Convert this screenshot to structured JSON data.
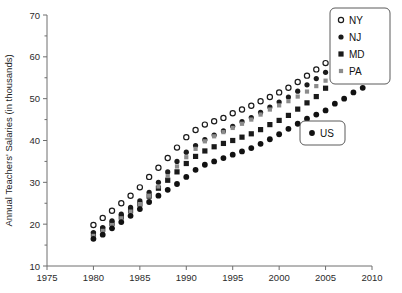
{
  "chart_data": {
    "type": "scatter",
    "title": "",
    "xlabel": "",
    "ylabel": "Annual Teachers' Salaries (in thousands)",
    "xlim": [
      1975,
      2010
    ],
    "ylim": [
      10,
      70
    ],
    "xticks": [
      1975,
      1980,
      1985,
      1990,
      1995,
      2000,
      2005,
      2010
    ],
    "yticks": [
      10,
      20,
      30,
      40,
      50,
      60,
      70
    ],
    "grid": false,
    "legend_position": "top-right",
    "x": [
      1980,
      1981,
      1982,
      1983,
      1984,
      1985,
      1986,
      1987,
      1988,
      1989,
      1990,
      1991,
      1992,
      1993,
      1994,
      1995,
      1996,
      1997,
      1998,
      1999,
      2000,
      2001,
      2002,
      2003,
      2004,
      2005,
      2006,
      2007,
      2008,
      2009
    ],
    "series": [
      {
        "name": "NY",
        "marker": "open-circle",
        "color": "#1a1a1a",
        "values": [
          19.8,
          21.5,
          23.2,
          25.0,
          26.8,
          28.8,
          31.3,
          33.5,
          35.8,
          38.3,
          40.8,
          42.5,
          43.8,
          44.6,
          45.4,
          46.5,
          47.4,
          48.3,
          49.4,
          50.4,
          51.5,
          52.6,
          54.0,
          55.5,
          57.0,
          58.5,
          60.7,
          63.0,
          65.0,
          67.0
        ]
      },
      {
        "name": "NJ",
        "marker": "filled-circle",
        "color": "#1a1a1a",
        "values": [
          18.0,
          19.2,
          20.8,
          22.4,
          24.0,
          25.6,
          27.6,
          30.0,
          32.5,
          35.0,
          37.2,
          38.8,
          40.2,
          41.3,
          42.3,
          43.4,
          44.5,
          45.5,
          46.7,
          48.0,
          49.2,
          50.4,
          51.8,
          53.3,
          54.8,
          56.3,
          58.2,
          60.0,
          61.5,
          63.0
        ]
      },
      {
        "name": "MD",
        "marker": "filled-square",
        "color": "#1a1a1a",
        "values": [
          17.6,
          18.8,
          20.2,
          21.7,
          23.2,
          24.8,
          26.7,
          28.6,
          30.5,
          32.5,
          34.5,
          36.2,
          37.5,
          38.5,
          39.3,
          40.0,
          40.8,
          41.6,
          42.6,
          43.8,
          44.8,
          46.0,
          47.5,
          49.0,
          50.5,
          52.5,
          54.5,
          56.5,
          58.5,
          60.0
        ]
      },
      {
        "name": "PA",
        "marker": "grey-square",
        "color": "#8c8c8c",
        "values": [
          17.2,
          18.4,
          19.8,
          21.4,
          23.0,
          24.8,
          26.8,
          29.0,
          31.5,
          33.8,
          36.0,
          38.0,
          39.8,
          41.0,
          42.0,
          43.0,
          44.0,
          45.0,
          46.2,
          47.4,
          48.4,
          49.4,
          50.5,
          51.7,
          53.0,
          54.3,
          55.8,
          57.5,
          59.0,
          60.5
        ]
      },
      {
        "name": "US",
        "marker": "filled-circle",
        "color": "#111111",
        "values": [
          16.5,
          17.5,
          19.0,
          20.5,
          22.0,
          23.6,
          25.3,
          26.8,
          28.2,
          29.6,
          31.3,
          33.0,
          34.2,
          35.0,
          35.8,
          36.6,
          37.4,
          38.2,
          39.2,
          40.3,
          41.5,
          42.8,
          44.0,
          45.2,
          46.2,
          47.2,
          48.8,
          50.0,
          51.5,
          52.6
        ]
      }
    ],
    "legends": [
      {
        "id": "state-legend",
        "entries": [
          {
            "label": "NY",
            "marker": "open-circle"
          },
          {
            "label": "NJ",
            "marker": "filled-circle"
          },
          {
            "label": "MD",
            "marker": "filled-square"
          },
          {
            "label": "PA",
            "marker": "grey-square"
          }
        ]
      },
      {
        "id": "us-legend",
        "entries": [
          {
            "label": "US",
            "marker": "filled-circle"
          }
        ]
      }
    ]
  }
}
